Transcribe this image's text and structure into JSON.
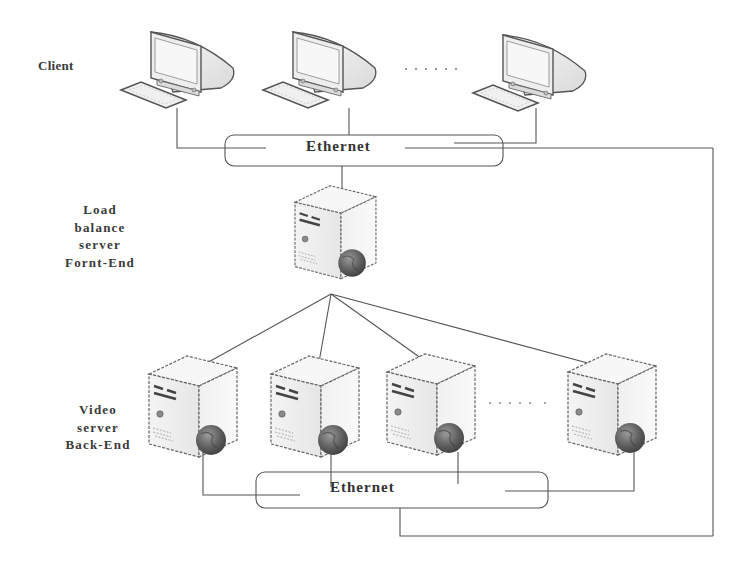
{
  "diagram": {
    "type": "network-architecture",
    "labels": {
      "client": "Client",
      "load_balancer": [
        "Load",
        "balance",
        "server",
        "Fornt-End"
      ],
      "video_server": [
        "Video",
        "server",
        "Back-End"
      ]
    },
    "networks": {
      "top": {
        "label": "Ethernet"
      },
      "bottom": {
        "label": "Ethernet"
      }
    },
    "ellipsis": "......",
    "nodes": {
      "clients": [
        {
          "id": "client-1",
          "icon": "desktop-computer-icon"
        },
        {
          "id": "client-2",
          "icon": "desktop-computer-icon"
        },
        {
          "id": "client-n",
          "icon": "desktop-computer-icon"
        }
      ],
      "load_balancer": {
        "id": "load-balance-server",
        "icon": "server-tower-icon"
      },
      "video_servers": [
        {
          "id": "video-server-1",
          "icon": "server-tower-icon"
        },
        {
          "id": "video-server-2",
          "icon": "server-tower-icon"
        },
        {
          "id": "video-server-3",
          "icon": "server-tower-icon"
        },
        {
          "id": "video-server-n",
          "icon": "server-tower-icon"
        }
      ]
    },
    "edges": [
      [
        "client-1",
        "ethernet-top"
      ],
      [
        "client-2",
        "ethernet-top"
      ],
      [
        "client-n",
        "ethernet-top"
      ],
      [
        "ethernet-top",
        "load-balance-server"
      ],
      [
        "load-balance-server",
        "video-server-1"
      ],
      [
        "load-balance-server",
        "video-server-2"
      ],
      [
        "load-balance-server",
        "video-server-3"
      ],
      [
        "load-balance-server",
        "video-server-n"
      ],
      [
        "video-server-1",
        "ethernet-bottom"
      ],
      [
        "video-server-2",
        "ethernet-bottom"
      ],
      [
        "video-server-3",
        "ethernet-bottom"
      ],
      [
        "video-server-n",
        "ethernet-bottom"
      ],
      [
        "ethernet-bottom",
        "ethernet-top"
      ]
    ],
    "colors": {
      "line": "#555555",
      "text": "#333333",
      "device_fill": "#f2f2f2",
      "device_edge": "#666666",
      "globe": "#5a5a5a"
    }
  }
}
